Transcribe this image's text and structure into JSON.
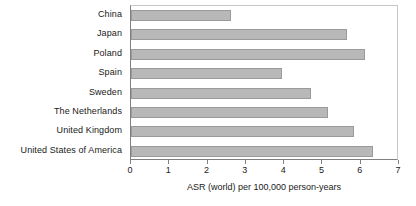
{
  "chart_data": {
    "type": "bar",
    "orientation": "horizontal",
    "title": "",
    "xlabel": "ASR (world) per 100,000 person-years",
    "ylabel": "",
    "xlim": [
      0,
      7
    ],
    "xticks": [
      "0",
      "1",
      "2",
      "3",
      "4",
      "5",
      "6",
      "7"
    ],
    "grid": false,
    "legend": "none",
    "bar_color": "#b8b8b8",
    "bar_border_color": "#9a9a9a",
    "axis_color": "#808080",
    "categories": [
      "China",
      "Japan",
      "Poland",
      "Spain",
      "Sweden",
      "The Netherlands",
      "United Kingdom",
      "United States of America"
    ],
    "values": [
      2.6,
      5.64,
      6.12,
      3.94,
      4.7,
      5.14,
      5.82,
      6.32
    ]
  }
}
